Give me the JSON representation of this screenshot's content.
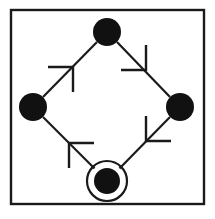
{
  "figure": {
    "width": 215,
    "height": 219,
    "background_color": "#ffffff"
  },
  "frame": {
    "name": "border-frame",
    "x": 11,
    "y": 10,
    "width": 193,
    "height": 194,
    "stroke_color": "#1a1a1a",
    "stroke_width": 2.4
  },
  "style": {
    "node_fill_color": "#111111",
    "edge_color": "#1a1a1a",
    "edge_width": 2.2,
    "arrow_color": "#1a1a1a",
    "arrow_width": 2.4,
    "ring_color": "#1a1a1a",
    "ring_width": 2.2
  },
  "nodes": [
    {
      "id": "top",
      "label": "",
      "cx": 107,
      "cy": 32,
      "r": 14,
      "shape": "filled-circle",
      "double_ring": false,
      "ring_r": 0
    },
    {
      "id": "left",
      "label": "",
      "cx": 33,
      "cy": 107,
      "r": 14,
      "shape": "filled-circle",
      "double_ring": false,
      "ring_r": 0
    },
    {
      "id": "right",
      "label": "",
      "cx": 180,
      "cy": 107,
      "r": 14,
      "shape": "filled-circle",
      "double_ring": false,
      "ring_r": 0
    },
    {
      "id": "bottom",
      "label": "",
      "cx": 107,
      "cy": 181,
      "r": 13,
      "shape": "filled-circle",
      "double_ring": true,
      "ring_r": 20
    }
  ],
  "edges": [
    {
      "id": "edge-bottom-left",
      "from": "bottom",
      "to": "left",
      "x1": 97,
      "y1": 171,
      "x2": 43,
      "y2": 117,
      "arrow_t": 0.52,
      "arrow_direction": "up-left"
    },
    {
      "id": "edge-left-top",
      "from": "left",
      "to": "top",
      "x1": 43,
      "y1": 97,
      "x2": 97,
      "y2": 42,
      "arrow_t": 0.52,
      "arrow_direction": "up-right"
    },
    {
      "id": "edge-top-right",
      "from": "top",
      "to": "right",
      "x1": 117,
      "y1": 42,
      "x2": 170,
      "y2": 97,
      "arrow_t": 0.52,
      "arrow_direction": "down-right"
    },
    {
      "id": "edge-right-bottom",
      "from": "right",
      "to": "bottom",
      "x1": 170,
      "y1": 117,
      "x2": 117,
      "y2": 171,
      "arrow_t": 0.52,
      "arrow_direction": "down-left"
    }
  ],
  "arrowheads": [
    {
      "id": "arrowhead-up-left",
      "tip_x": 69,
      "tip_y": 143,
      "angle_deg": 225,
      "barb1_dx": 25,
      "barb1_dy": 0,
      "barb2_dx": 0,
      "barb2_dy": 25
    },
    {
      "id": "arrowhead-up-right",
      "tip_x": 73,
      "tip_y": 67,
      "angle_deg": 315,
      "barb1_dx": -25,
      "barb1_dy": 0,
      "barb2_dx": 0,
      "barb2_dy": 25
    },
    {
      "id": "arrowhead-down-right",
      "tip_x": 146,
      "tip_y": 70,
      "angle_deg": 45,
      "barb1_dx": -25,
      "barb1_dy": 0,
      "barb2_dx": 0,
      "barb2_dy": -25
    },
    {
      "id": "arrowhead-down-left",
      "tip_x": 146,
      "tip_y": 141,
      "angle_deg": 135,
      "barb1_dx": 25,
      "barb1_dy": 0,
      "barb2_dx": 0,
      "barb2_dy": -25
    }
  ]
}
